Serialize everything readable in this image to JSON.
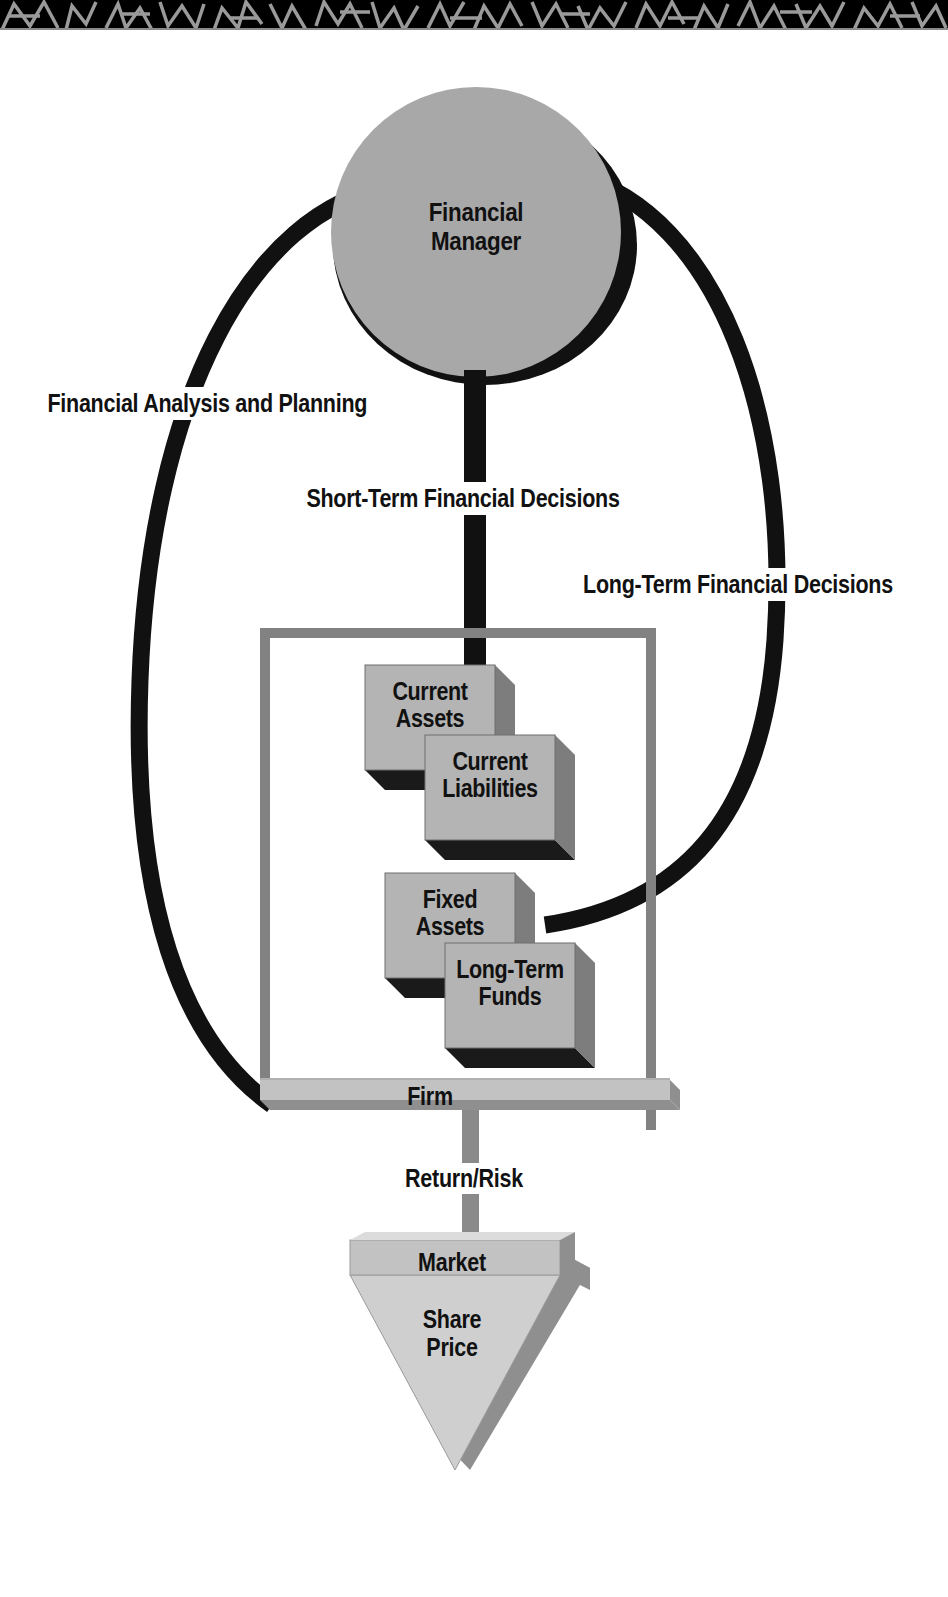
{
  "figure": {
    "type": "flow-diagram",
    "top_decoration": "geometric-pattern-band"
  },
  "nodes": {
    "financial_manager": {
      "label": "Financial\nManager",
      "line1": "Financial",
      "line2": "Manager",
      "shape": "circle",
      "fill": "#a8a8a8"
    },
    "firm": {
      "label": "Firm",
      "shape": "bordered-frame",
      "border_color": "#828282",
      "bar_color": "#c2c2c2"
    },
    "market": {
      "title": "Market",
      "body_line1": "Share",
      "body_line2": "Price",
      "shape": "inverted-triangle",
      "fill": "#cfcfcf",
      "band_fill": "#c2c2c2",
      "bevel_fill": "#8f8f8f"
    }
  },
  "boxes": [
    {
      "id": "current-assets",
      "line1": "Current",
      "line2": "Assets"
    },
    {
      "id": "current-liabilities",
      "line1": "Current",
      "line2": "Liabilities"
    },
    {
      "id": "fixed-assets",
      "line1": "Fixed",
      "line2": "Assets"
    },
    {
      "id": "long-term-funds",
      "line1": "Long-Term",
      "line2": "Funds"
    }
  ],
  "connector_labels": {
    "analysis": "Financial Analysis and Planning",
    "short_term": "Short-Term Financial Decisions",
    "long_term": "Long-Term Financial Decisions",
    "return_risk": "Return/Risk"
  },
  "colors": {
    "black": "#111111",
    "circle_gray": "#a8a8a8",
    "box_face": "#b4b4b4",
    "box_side": "#7d7d7d",
    "box_bottom": "#1a1a1a",
    "frame_gray": "#828282",
    "bar_gray": "#c2c2c2",
    "connector_gray": "#8a8a8a",
    "triangle_light": "#cfcfcf",
    "triangle_bevel": "#8f8f8f",
    "background": "#ffffff"
  }
}
